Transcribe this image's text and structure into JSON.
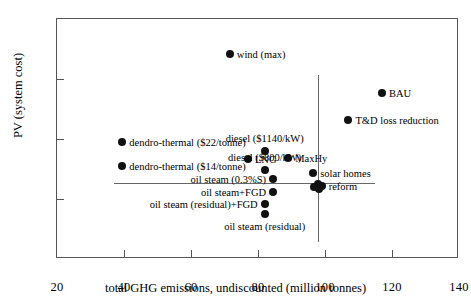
{
  "chart_data": {
    "type": "scatter",
    "title": "",
    "xlabel": "total GHG emissions, undiscounted (million tonnes)",
    "ylabel": "PV (system cost)",
    "xlim": [
      20,
      140
    ],
    "ylim": [
      2200,
      3000
    ],
    "xticks": [
      20,
      40,
      60,
      80,
      100,
      120,
      140
    ],
    "yticks": [
      2200,
      2400,
      2600,
      2800,
      3000
    ],
    "grid": false,
    "legend": "none",
    "points": [
      {
        "label": "wind (max)",
        "x": 71.6,
        "y": 2883,
        "label_pos": "rgt"
      },
      {
        "label": "BAU",
        "x": 117.0,
        "y": 2752,
        "label_pos": "rgt"
      },
      {
        "label": "T&D loss reduction",
        "x": 107.0,
        "y": 2663,
        "label_pos": "rgt"
      },
      {
        "label": "dendro-thermal ($22/tonne)",
        "x": 39.5,
        "y": 2590,
        "label_pos": "rgt"
      },
      {
        "label": "diesel ($1140/kW)",
        "x": 82.0,
        "y": 2560,
        "label_pos": "top"
      },
      {
        "label": "LNG",
        "x": 77.0,
        "y": 2533,
        "label_pos": "rgt"
      },
      {
        "label": "MaxHy",
        "x": 89.0,
        "y": 2537,
        "label_pos": "rgt"
      },
      {
        "label": "dendro-thermal ($14/tonne)",
        "x": 39.5,
        "y": 2510,
        "label_pos": "rgt"
      },
      {
        "label": "diesel ($800/kW)",
        "x": 82.0,
        "y": 2497,
        "label_pos": "top"
      },
      {
        "label": "solar homes",
        "x": 96.5,
        "y": 2487,
        "label_pos": "rgt"
      },
      {
        "label": "oil steam (0.3%S)",
        "x": 84.5,
        "y": 2466,
        "label_pos": "lft"
      },
      {
        "label": "reform",
        "x": 99.0,
        "y": 2443,
        "label_pos": "rgt"
      },
      {
        "label": "",
        "x": 96.6,
        "y": 2441,
        "label_pos": "rgt"
      },
      {
        "label": "",
        "x": 97.8,
        "y": 2449,
        "label_pos": "rgt"
      },
      {
        "label": "",
        "x": 98.2,
        "y": 2432,
        "label_pos": "rgt"
      },
      {
        "label": "oil steam+FGD",
        "x": 84.5,
        "y": 2423,
        "label_pos": "lft"
      },
      {
        "label": "oil steam (residual)+FGD",
        "x": 82.0,
        "y": 2385,
        "label_pos": "lft"
      },
      {
        "label": "oil steam (residual)",
        "x": 82.0,
        "y": 2350,
        "label_pos": "bot"
      }
    ],
    "reference_lines": [
      {
        "orientation": "horizontal",
        "value": 2455,
        "x_start": 37.0,
        "x_end": 115.0
      },
      {
        "orientation": "vertical",
        "value": 98.0,
        "y_start": 2257,
        "y_end": 2815
      }
    ]
  }
}
